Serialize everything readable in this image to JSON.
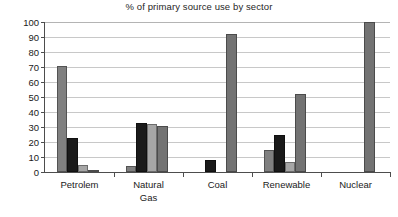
{
  "chart_data": {
    "type": "bar",
    "title": "% of primary source use by sector",
    "xlabel": "",
    "ylabel": "",
    "ylim": [
      0,
      100
    ],
    "yticks": [
      0,
      10,
      20,
      30,
      40,
      50,
      60,
      70,
      80,
      90,
      100
    ],
    "ytick_labels": [
      "0",
      "10",
      "20",
      "30",
      "40",
      "50",
      "60",
      "70",
      "80",
      "90",
      "100"
    ],
    "grid": true,
    "legend": false,
    "legend_position": "none",
    "categories": [
      "Petrolem",
      "Natural\nGas",
      "Coal",
      "Renewable",
      "Nuclear"
    ],
    "series": [
      {
        "name": "Series 1",
        "color": "#808080",
        "values": [
          71,
          4,
          0,
          15,
          0
        ]
      },
      {
        "name": "Series 2",
        "color": "#1a1a1a",
        "values": [
          23,
          33,
          8,
          25,
          0
        ]
      },
      {
        "name": "Series 3",
        "color": "#a6a6a6",
        "values": [
          5,
          32,
          0,
          7,
          0
        ]
      },
      {
        "name": "Series 4",
        "color": "#737373",
        "values": [
          1,
          31,
          92,
          52,
          100
        ]
      }
    ]
  },
  "axis": {
    "line_color": "#4d4d4d",
    "grid_color": "#c8c8c8"
  }
}
